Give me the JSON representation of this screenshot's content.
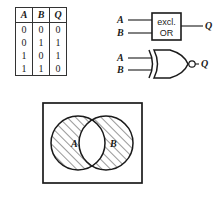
{
  "figure": {
    "stroke_color": "#1a1a1a",
    "background_color": "#ffffff"
  },
  "truth_table": {
    "name": "xor-truth-table",
    "columns": [
      "A",
      "B",
      "Q"
    ],
    "rows": [
      [
        "0",
        "0",
        "0"
      ],
      [
        "0",
        "1",
        "1"
      ],
      [
        "1",
        "0",
        "1"
      ],
      [
        "1",
        "1",
        "0"
      ]
    ]
  },
  "block_symbol": {
    "name": "excl-or-block-symbol",
    "box_line1": "excl.",
    "box_line2": "OR",
    "input_a": "A",
    "input_b": "B",
    "output": "Q"
  },
  "gate_symbol": {
    "name": "xor-gate-symbol",
    "input_a": "A",
    "input_b": "B",
    "output": "Q",
    "has_output_bubble": true
  },
  "venn": {
    "name": "xor-venn-diagram",
    "circle_a_label": "A",
    "circle_b_label": "B",
    "shaded_regions": [
      "A only",
      "B only"
    ],
    "unshaded_regions": [
      "A and B"
    ],
    "hatch_angle_degrees": 45
  }
}
